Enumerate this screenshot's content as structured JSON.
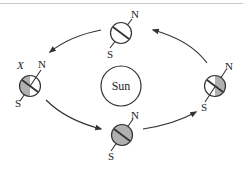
{
  "diagram": {
    "title": "",
    "sun": {
      "label": "Sun"
    },
    "earths": [
      {
        "id": "top",
        "north_label": "N",
        "south_label": "S",
        "shading": "none"
      },
      {
        "id": "left",
        "north_label": "N",
        "south_label": "S",
        "marker_label": "X",
        "shading": "left-half"
      },
      {
        "id": "bottom",
        "north_label": "N",
        "south_label": "S",
        "shading": "full"
      },
      {
        "id": "right",
        "north_label": "N",
        "south_label": "S",
        "shading": "right-half"
      }
    ],
    "orbit_direction": "counterclockwise",
    "colors": {
      "line": "#333333",
      "shade": "#b0b0b0",
      "background": "#ffffff"
    }
  }
}
